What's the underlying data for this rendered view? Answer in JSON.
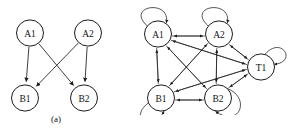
{
  "figure": {
    "panels": [
      {
        "id": "a",
        "caption": "(a)",
        "description": "sparse bipartite directed acyclic graph",
        "nodes": [
          {
            "id": "A1",
            "label": "A1",
            "cx": 30,
            "cy": 33,
            "r": 13.5
          },
          {
            "id": "A2",
            "label": "A2",
            "cx": 88,
            "cy": 33,
            "r": 13.5
          },
          {
            "id": "B1",
            "label": "B1",
            "cx": 25,
            "cy": 98,
            "r": 13.5
          },
          {
            "id": "B2",
            "label": "B2",
            "cx": 84,
            "cy": 98,
            "r": 13.5
          }
        ],
        "edges": [
          {
            "from": "A1",
            "to": "B1"
          },
          {
            "from": "A1",
            "to": "B2"
          },
          {
            "from": "A2",
            "to": "B1"
          },
          {
            "from": "A2",
            "to": "B2"
          }
        ],
        "self_loops": []
      },
      {
        "id": "b",
        "caption": "(b)",
        "description": "dense complete directed graph with self loops",
        "nodes": [
          {
            "id": "A1",
            "label": "A1",
            "cx": 18,
            "cy": 34,
            "r": 13.5
          },
          {
            "id": "A2",
            "label": "A2",
            "cx": 79,
            "cy": 34,
            "r": 13.5
          },
          {
            "id": "T1",
            "label": "T1",
            "cx": 121,
            "cy": 67,
            "r": 13.5
          },
          {
            "id": "B1",
            "label": "B1",
            "cx": 21,
            "cy": 98,
            "r": 13.5
          },
          {
            "id": "B2",
            "label": "B2",
            "cx": 78,
            "cy": 98,
            "r": 13.5
          }
        ],
        "edges": [
          {
            "from": "A1",
            "to": "A2"
          },
          {
            "from": "A2",
            "to": "A1"
          },
          {
            "from": "A1",
            "to": "T1"
          },
          {
            "from": "T1",
            "to": "A1"
          },
          {
            "from": "A1",
            "to": "B1"
          },
          {
            "from": "B1",
            "to": "A1"
          },
          {
            "from": "A1",
            "to": "B2"
          },
          {
            "from": "B2",
            "to": "A1"
          },
          {
            "from": "A2",
            "to": "T1"
          },
          {
            "from": "T1",
            "to": "A2"
          },
          {
            "from": "A2",
            "to": "B1"
          },
          {
            "from": "B1",
            "to": "A2"
          },
          {
            "from": "A2",
            "to": "B2"
          },
          {
            "from": "B2",
            "to": "A2"
          },
          {
            "from": "T1",
            "to": "B1"
          },
          {
            "from": "B1",
            "to": "T1"
          },
          {
            "from": "T1",
            "to": "B2"
          },
          {
            "from": "B2",
            "to": "T1"
          },
          {
            "from": "B1",
            "to": "B2"
          },
          {
            "from": "B2",
            "to": "B1"
          }
        ],
        "self_loops": [
          {
            "node": "A1",
            "direction": "upper-left"
          },
          {
            "node": "A2",
            "direction": "upper-left"
          },
          {
            "node": "T1",
            "direction": "upper-right"
          },
          {
            "node": "B1",
            "direction": "lower-left"
          },
          {
            "node": "B2",
            "direction": "lower-right"
          }
        ]
      }
    ]
  },
  "colors": {
    "ink": "#1c1c1c",
    "background": "#ffffff"
  }
}
